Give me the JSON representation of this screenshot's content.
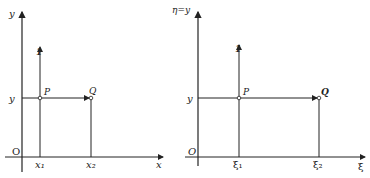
{
  "diagrams": [
    {
      "id": "left",
      "y_axis_label": "y",
      "x_axis_label": "x",
      "origin_label": "O",
      "level_label": "y",
      "point_p_label": "P",
      "point_q_label": "Q",
      "tick1_label": "x₁",
      "tick2_label": "x₂",
      "marker_label": "1"
    },
    {
      "id": "right",
      "y_axis_label": "η=y",
      "x_axis_label": "ξ",
      "origin_label": "O",
      "level_label": "y",
      "point_p_label": "P",
      "point_q_label": "Q",
      "tick1_label": "ξ₁",
      "tick2_label": "ξ₂",
      "marker_label": "1"
    }
  ],
  "colors": {
    "line": "#222222",
    "background": "#ffffff"
  }
}
